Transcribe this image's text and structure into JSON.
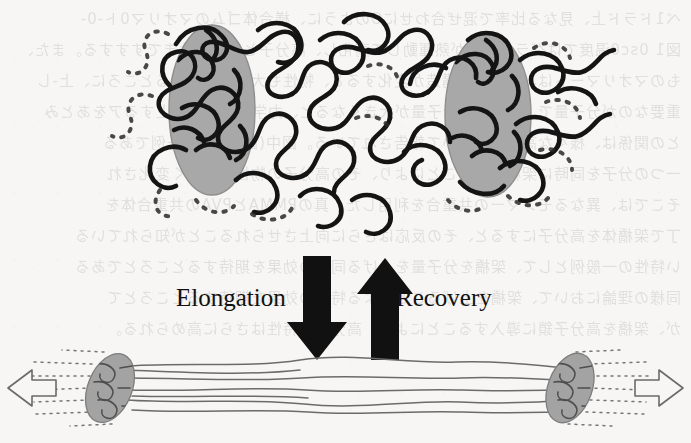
{
  "figure": {
    "name": "polymer-elongation-recovery-schematic",
    "background_color": "#f7f6f4",
    "width": 691,
    "height": 443
  },
  "labels": {
    "elongation": "Elongation",
    "recovery": "Recovery"
  },
  "arrows": {
    "down_arrow_name": "elongation-arrow-down",
    "up_arrow_name": "recovery-arrow-up",
    "left_pull_name": "tension-arrow-left",
    "right_pull_name": "tension-arrow-right",
    "block_arrow_color": "#111111",
    "pull_arrow_stroke": "#6a6a6a"
  },
  "panels": {
    "relaxed": {
      "name": "relaxed-coiled-state",
      "description": "Two gray aggregate domains joined by randomly coiled thick polymer chains",
      "domain_fill": "#a8a8a8",
      "domain_stroke": "#8e8e8e",
      "chain_color": "#141414",
      "chain_width": 4.6,
      "domains": [
        {
          "name": "aggregate-domain-left",
          "cx": 212,
          "cy": 110,
          "rx": 43,
          "ry": 85,
          "rotate": 0
        },
        {
          "name": "aggregate-domain-right",
          "cx": 488,
          "cy": 115,
          "rx": 43,
          "ry": 82,
          "rotate": 0
        }
      ]
    },
    "stretched": {
      "name": "elongated-oriented-state",
      "description": "Two tilted gray aggregate domains with chains drawn out nearly straight under tension",
      "domain_fill": "#a3a3a3",
      "domain_stroke": "#7d7d7d",
      "chain_color": "#6b6b6b",
      "chain_width": 1.5,
      "domains": [
        {
          "name": "aggregate-domain-bottom-left",
          "cx": 110,
          "cy": 388,
          "rx": 22,
          "ry": 36,
          "rotate": 22
        },
        {
          "name": "aggregate-domain-bottom-right",
          "cx": 570,
          "cy": 388,
          "rx": 22,
          "ry": 36,
          "rotate": 20
        }
      ]
    }
  },
  "bleed_text": "ベ1ドラド上、見なる比率で混ぜ合わせにOのように、様合体ゴムのマオリマ0ト-0-\n図1 0sc0温度ではグラス分子が熱運動して高化し、高分子としての性まですすする。また、\nものマオリマートは、高分子の構造が変化すると、物性も大きく変化するところに、上-し\n重要なのが分子量で、高分子の分子量が大きくなると、力学的性質が向上するアをあとみ\nとの関係は、様々な高分子において報告されている。図中(図) はその一例である\n一つの分子を同時に架橋させることにより、その高分子の物性は大きく変化され\nそこでは、異なるモノマーの共重合を利用した。真のPMMAとPVAの共重合体を\n丁で架橋体を高分子にすると、その反応はさらに向上させられることが知られている\nい特性の一般例として、架橋を分子量を上げる同様の効果を期待するところとである\n同様の理論において、架橋を上げることによる特性の効果を期待するところとて\nが、架橋を高分子鎖に導入することにより、高分子の特性はさらに高められる。"
}
